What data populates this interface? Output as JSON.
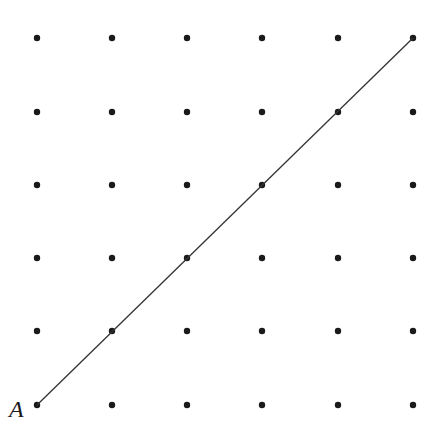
{
  "diagram": {
    "grid": {
      "cols": 6,
      "rows": 6,
      "x_positions": [
        37,
        112,
        187,
        262,
        338,
        413
      ],
      "y_positions": [
        38,
        112,
        185,
        258,
        331,
        405
      ],
      "dot_radius": 3.2,
      "dot_color": "#1a1a1a"
    },
    "line": {
      "from": [
        37,
        405
      ],
      "to": [
        413,
        38
      ],
      "color": "#333333",
      "width": 1.3
    },
    "labels": [
      {
        "text": "A",
        "x": 9,
        "y": 396
      }
    ]
  }
}
